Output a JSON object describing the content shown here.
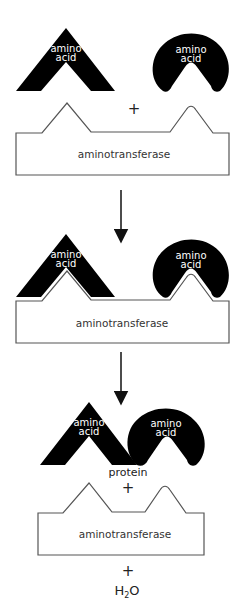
{
  "diagram": {
    "stages": [
      {
        "molecules": [
          {
            "shape": "triangle",
            "label_line1": "amino",
            "label_line2": "acid"
          },
          {
            "shape": "arc",
            "label_line1": "amino",
            "label_line2": "acid"
          }
        ],
        "plus": "+",
        "enzyme_label": "aminotransferase"
      },
      {
        "molecules": [
          {
            "shape": "triangle",
            "label_line1": "amino",
            "label_line2": "acid"
          },
          {
            "shape": "arc",
            "label_line1": "amino",
            "label_line2": "acid"
          }
        ],
        "enzyme_label": "aminotransferase"
      },
      {
        "molecules": [
          {
            "shape": "triangle",
            "label_line1": "amino",
            "label_line2": "acid"
          },
          {
            "shape": "arc",
            "label_line1": "amino",
            "label_line2": "acid"
          }
        ],
        "product_label": "protein",
        "plus": "+",
        "enzyme_label": "aminotransferase",
        "plus2": "+",
        "byproduct": {
          "main": "H",
          "subscript": "2",
          "tail": "O"
        }
      }
    ],
    "arrows": [
      "down-arrow",
      "down-arrow"
    ],
    "colors": {
      "molecule": "#000000",
      "enzyme_stroke": "#555555",
      "text": "#333333"
    }
  }
}
